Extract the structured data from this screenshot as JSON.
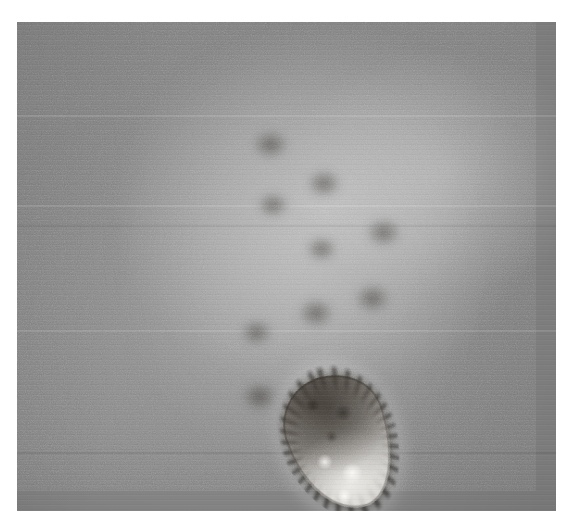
{
  "figure": {
    "kind": "transmission-electron-micrograph",
    "alt_text": "Black-and-white transmission electron micrograph showing a cluster of roughly spherical influenza virus particles with a fringe of surface glycoprotein spikes, plus one larger elongated pleomorphic particle at lower centre.",
    "image_width_px": 567,
    "image_height_px": 526,
    "border": {
      "left_px": 17,
      "top_px": 22,
      "right_px": 11,
      "bottom_px": 15
    },
    "plate": {
      "left_px": 17,
      "top_px": 22,
      "width_px": 539,
      "height_px": 489
    },
    "colors": {
      "page_background": "#ffffff",
      "field_background": "#848484",
      "particle_envelope": "#221f1b",
      "particle_core": "#e8e4dd",
      "halo_highlight": "#ffffff"
    },
    "rendering": {
      "grayscale": true,
      "grain": true,
      "scanlines": true
    }
  },
  "particles": {
    "spherical_count": 18,
    "pleomorphic_count": 1,
    "items": [
      {
        "id": "virion-01",
        "label": "isolated virion, upper left",
        "cx_pct": 36.5,
        "cy_pct": 8.5,
        "w_pct": 15.5,
        "h_pct": 17.6,
        "rot_deg": -14,
        "core_brightness": 0.96
      },
      {
        "id": "virion-02",
        "label": "virion, upper cluster left",
        "cx_pct": 51.0,
        "cy_pct": 19.5,
        "w_pct": 15.0,
        "h_pct": 17.0,
        "rot_deg": 8,
        "core_brightness": 0.8
      },
      {
        "id": "virion-03",
        "label": "virion, upper cluster right",
        "cx_pct": 61.5,
        "cy_pct": 25.0,
        "w_pct": 15.2,
        "h_pct": 17.2,
        "rot_deg": -6,
        "core_brightness": 0.82
      },
      {
        "id": "virion-04",
        "label": "virion, left of centre upper",
        "cx_pct": 43.5,
        "cy_pct": 31.0,
        "w_pct": 14.2,
        "h_pct": 16.2,
        "rot_deg": 16,
        "core_brightness": 0.9
      },
      {
        "id": "virion-05",
        "label": "isolated virion, middle left",
        "cx_pct": 29.5,
        "cy_pct": 43.5,
        "w_pct": 13.8,
        "h_pct": 15.4,
        "rot_deg": -8,
        "core_brightness": 0.95
      },
      {
        "id": "virion-06",
        "label": "small virion, centre left",
        "cx_pct": 41.0,
        "cy_pct": 43.0,
        "w_pct": 12.8,
        "h_pct": 14.4,
        "rot_deg": 22,
        "core_brightness": 0.84
      },
      {
        "id": "virion-07",
        "label": "virion, centre",
        "cx_pct": 52.5,
        "cy_pct": 41.5,
        "w_pct": 15.0,
        "h_pct": 17.2,
        "rot_deg": -4,
        "core_brightness": 0.78
      },
      {
        "id": "virion-08",
        "label": "virion, centre right upper",
        "cx_pct": 63.0,
        "cy_pct": 38.0,
        "w_pct": 14.4,
        "h_pct": 16.2,
        "rot_deg": 10,
        "core_brightness": 0.86
      },
      {
        "id": "virion-09",
        "label": "virion, far right upper",
        "cx_pct": 74.5,
        "cy_pct": 35.5,
        "w_pct": 14.8,
        "h_pct": 16.6,
        "rot_deg": -16,
        "core_brightness": 0.88
      },
      {
        "id": "virion-10",
        "label": "virion, centre right lower",
        "cx_pct": 60.5,
        "cy_pct": 50.5,
        "w_pct": 14.0,
        "h_pct": 16.4,
        "rot_deg": 6,
        "core_brightness": 0.8
      },
      {
        "id": "virion-11",
        "label": "virion, far right lower",
        "cx_pct": 72.0,
        "cy_pct": 50.0,
        "w_pct": 14.2,
        "h_pct": 15.8,
        "rot_deg": -10,
        "core_brightness": 0.88
      },
      {
        "id": "virion-12",
        "label": "virion, centre lower",
        "cx_pct": 48.5,
        "cy_pct": 54.5,
        "w_pct": 14.2,
        "h_pct": 16.0,
        "rot_deg": 18,
        "core_brightness": 0.84
      },
      {
        "id": "virion-13",
        "label": "virion, lower cluster right",
        "cx_pct": 61.5,
        "cy_pct": 65.0,
        "w_pct": 14.0,
        "h_pct": 15.8,
        "rot_deg": -12,
        "core_brightness": 0.86
      },
      {
        "id": "virion-14",
        "label": "virion, lower cluster left",
        "cx_pct": 38.5,
        "cy_pct": 69.5,
        "w_pct": 14.2,
        "h_pct": 15.6,
        "rot_deg": 12,
        "core_brightness": 0.88
      },
      {
        "id": "virion-15",
        "label": "virion, lower cluster centre",
        "cx_pct": 50.5,
        "cy_pct": 70.5,
        "w_pct": 14.6,
        "h_pct": 16.4,
        "rot_deg": -5,
        "core_brightness": 0.9
      },
      {
        "id": "virion-16",
        "label": "virion, bottom centre",
        "cx_pct": 45.0,
        "cy_pct": 82.0,
        "w_pct": 14.4,
        "h_pct": 16.2,
        "rot_deg": 14,
        "core_brightness": 0.8
      },
      {
        "id": "virion-17",
        "label": "isolated virion, lower left",
        "cx_pct": 26.5,
        "cy_pct": 86.5,
        "w_pct": 12.6,
        "h_pct": 13.8,
        "rot_deg": -6,
        "core_brightness": 0.78
      },
      {
        "id": "virion-18",
        "label": "partial virion, right edge of cluster",
        "cx_pct": 69.5,
        "cy_pct": 60.5,
        "w_pct": 11.0,
        "h_pct": 12.4,
        "rot_deg": 4,
        "core_brightness": 0.74
      }
    ],
    "pleomorphic": {
      "id": "pleomorphic-particle",
      "label": "elongated pleomorphic virus particle, bottom centre",
      "cx_pct": 60.0,
      "cy_pct": 86.0,
      "w_pct": 19.0,
      "h_pct": 28.0,
      "rot_deg": -18
    },
    "bridges": [
      {
        "cx_pct": 47.0,
        "cy_pct": 25.0,
        "w_pct": 9,
        "h_pct": 8
      },
      {
        "cx_pct": 57.0,
        "cy_pct": 33.0,
        "w_pct": 9,
        "h_pct": 8
      },
      {
        "cx_pct": 47.5,
        "cy_pct": 37.5,
        "w_pct": 8,
        "h_pct": 7
      },
      {
        "cx_pct": 68.0,
        "cy_pct": 43.0,
        "w_pct": 9,
        "h_pct": 8
      },
      {
        "cx_pct": 56.5,
        "cy_pct": 46.5,
        "w_pct": 8,
        "h_pct": 7
      },
      {
        "cx_pct": 66.0,
        "cy_pct": 56.5,
        "w_pct": 9,
        "h_pct": 8
      },
      {
        "cx_pct": 55.5,
        "cy_pct": 59.5,
        "w_pct": 9,
        "h_pct": 8
      },
      {
        "cx_pct": 44.5,
        "cy_pct": 63.5,
        "w_pct": 8,
        "h_pct": 7
      },
      {
        "cx_pct": 45.0,
        "cy_pct": 76.5,
        "w_pct": 9,
        "h_pct": 8
      },
      {
        "cx_pct": 55.0,
        "cy_pct": 78.0,
        "w_pct": 10,
        "h_pct": 9
      }
    ]
  },
  "artifact_bands": [
    {
      "top_pct": 19.0,
      "height_px": 2,
      "tone": "light"
    },
    {
      "top_pct": 37.5,
      "height_px": 2,
      "tone": "light"
    },
    {
      "top_pct": 41.5,
      "height_px": 2,
      "tone": "dark"
    },
    {
      "top_pct": 63.0,
      "height_px": 2,
      "tone": "light"
    },
    {
      "top_pct": 88.0,
      "height_px": 2,
      "tone": "dark"
    }
  ]
}
